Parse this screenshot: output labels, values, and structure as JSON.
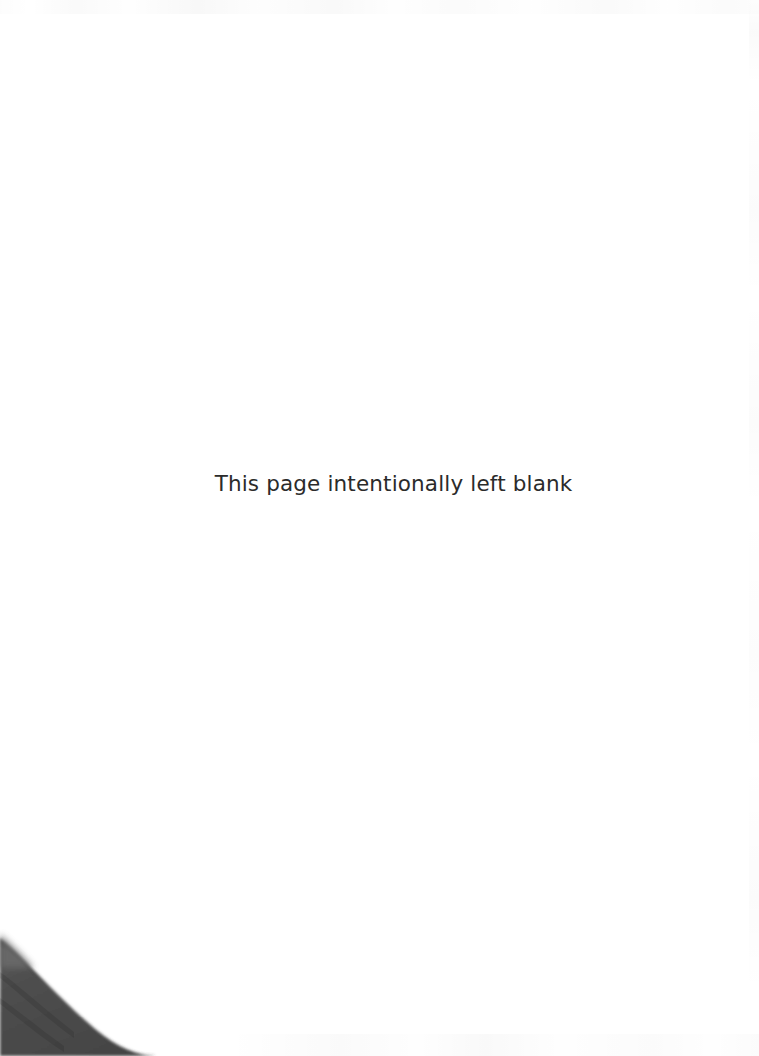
{
  "page": {
    "width": 759,
    "height": 1056,
    "background_color": "#ffffff",
    "kind": "scanned-book-page"
  },
  "notice": {
    "text": "This page intentionally left blank",
    "color": "#2b2b2b",
    "font_size_px": 21.5,
    "align": "center"
  },
  "artifacts": {
    "corner_shadow": {
      "name": "book-edge-shadow",
      "position": "bottom-left",
      "color": "#4a4a4a",
      "edge_color": "#3a3a3a"
    },
    "scan_noise": {
      "top": "faint-speckle-band",
      "right": "faint-edge-streaks",
      "bottom": "faint-speckle-band"
    }
  }
}
